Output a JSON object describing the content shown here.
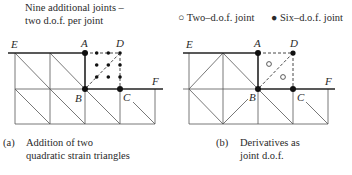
{
  "panel_a": {
    "header_line1": "Nine additional joints –",
    "header_line2": "two d.o.f. per joint",
    "caption_tag": "(a)",
    "caption_line1": "Addition of two",
    "caption_line2": "quadratic strain triangles",
    "labels": {
      "E": "E",
      "A": "A",
      "D": "D",
      "B": "B",
      "C": "C",
      "F": "F"
    }
  },
  "panel_b": {
    "legend": {
      "two_dof_symbol": "○",
      "two_dof_label": "Two–d.o.f. joint",
      "six_dof_symbol": "●",
      "six_dof_label": "Six–d.o.f. joint"
    },
    "caption_tag": "(b)",
    "caption_line1": "Derivatives as",
    "caption_line2": "joint d.o.f.",
    "labels": {
      "E": "E",
      "A": "A",
      "D": "D",
      "B": "B",
      "C": "C",
      "F": "F"
    }
  },
  "colors": {
    "line": "#333333",
    "thin_line": "#555555",
    "background": "#ffffff"
  }
}
